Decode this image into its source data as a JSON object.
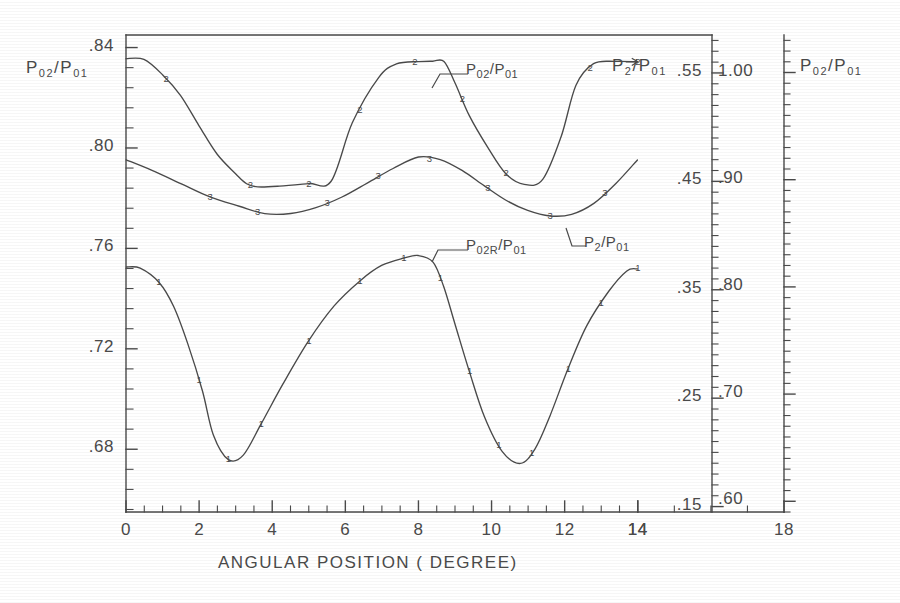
{
  "chart_data": {
    "type": "line",
    "title": "",
    "xlabel": "ANGULAR POSITION ( DEGREE)",
    "xlim": [
      0,
      18
    ],
    "x_ticks": [
      0,
      2,
      4,
      6,
      8,
      10,
      12,
      14,
      18
    ],
    "x_tick_labels": [
      "0",
      "2",
      "4",
      "6",
      "8",
      "10",
      "12",
      "14",
      "18"
    ],
    "x_extra_tick_label": "14",
    "grid": false,
    "legend_position": "inline-annotations",
    "axes": [
      {
        "id": "left",
        "label": "P02/P01",
        "label_parts": {
          "base1": "P",
          "sub1": "02",
          "slash": "/",
          "base2": "P",
          "sub2": "01"
        },
        "ticks": [
          0.68,
          0.72,
          0.76,
          0.8,
          0.84
        ],
        "tick_labels": [
          ".68",
          ".72",
          ".76",
          ".80",
          ".84"
        ],
        "lim": [
          0.655,
          0.845
        ],
        "minor_per_major": 4,
        "side": "left"
      },
      {
        "id": "mid-right",
        "label": "P2/P01",
        "label_parts": {
          "base1": "P",
          "sub1": "2",
          "slash": "/",
          "base2": "P",
          "sub2": "01"
        },
        "ticks": [
          0.15,
          0.25,
          0.35,
          0.45,
          0.55
        ],
        "tick_labels": [
          ".15",
          ".25",
          ".35",
          ".45",
          ".55"
        ],
        "lim": [
          0.145,
          0.585
        ],
        "minor_per_major": 10,
        "side": "right"
      },
      {
        "id": "far-right",
        "label": "P02/P01",
        "label_parts": {
          "base1": "P",
          "sub1": "02",
          "slash": "/",
          "base2": "P",
          "sub2": "01"
        },
        "ticks": [
          0.6,
          0.7,
          0.8,
          0.9,
          1.0
        ],
        "tick_labels": [
          ".60",
          ".70",
          ".80",
          ".90",
          "1.00"
        ],
        "lim": [
          0.59,
          1.035
        ],
        "minor_per_major": 10,
        "side": "right"
      }
    ],
    "series": [
      {
        "name": "P02/P01",
        "annotation": "P02/P01",
        "annotation_parts": {
          "base1": "P",
          "sub1": "02",
          "slash": "/",
          "base2": "P",
          "sub2": "01"
        },
        "marker": "2",
        "axis": "far-right",
        "x": [
          0.0,
          0.5,
          1.0,
          1.5,
          2.0,
          2.5,
          3.0,
          3.3,
          3.6,
          4.2,
          5.0,
          5.6,
          6.2,
          6.9,
          7.4,
          8.0,
          8.4,
          8.7,
          9.0,
          9.4,
          9.9,
          10.4,
          10.9,
          11.4,
          11.9,
          12.3,
          12.8,
          13.4,
          14.0
        ],
        "y": [
          1.013,
          1.012,
          0.998,
          0.979,
          0.95,
          0.924,
          0.905,
          0.896,
          0.893,
          0.894,
          0.896,
          0.899,
          0.953,
          0.995,
          1.008,
          1.01,
          1.011,
          1.01,
          0.99,
          0.96,
          0.93,
          0.906,
          0.896,
          0.9,
          0.94,
          0.988,
          1.008,
          1.01,
          1.01
        ],
        "marker_x": [
          1.1,
          3.4,
          5.0,
          6.4,
          7.9,
          9.2,
          10.4,
          12.7,
          14.0
        ],
        "arrow_at_end": true
      },
      {
        "name": "P2/P01",
        "annotation": "P 2/P01",
        "annotation_parts": {
          "base1": "P",
          "sub1": "2",
          "slash": "/",
          "base2": "P",
          "sub2": "01"
        },
        "marker": "3",
        "axis": "mid-right",
        "x": [
          0.0,
          0.7,
          1.5,
          2.3,
          3.1,
          3.8,
          4.5,
          5.2,
          5.9,
          6.6,
          7.3,
          8.0,
          8.6,
          9.2,
          9.8,
          10.4,
          11.0,
          11.6,
          12.2,
          12.8,
          13.4,
          14.0
        ],
        "y": [
          0.47,
          0.46,
          0.448,
          0.436,
          0.427,
          0.42,
          0.42,
          0.426,
          0.436,
          0.449,
          0.462,
          0.472,
          0.47,
          0.46,
          0.446,
          0.433,
          0.423,
          0.418,
          0.42,
          0.43,
          0.448,
          0.47
        ],
        "marker_x": [
          2.3,
          3.6,
          5.5,
          6.9,
          8.3,
          9.9,
          11.6,
          13.1
        ],
        "arrow_at_end": false
      },
      {
        "name": "P02R/P01",
        "annotation": "P02R/P01",
        "annotation_parts": {
          "base1": "P",
          "sub1": "02R",
          "slash": "/",
          "base2": "P",
          "sub2": "01"
        },
        "marker": "1",
        "axis": "left",
        "x": [
          0.0,
          0.4,
          0.9,
          1.3,
          1.7,
          2.1,
          2.4,
          2.8,
          3.2,
          3.7,
          4.3,
          5.0,
          5.7,
          6.4,
          7.0,
          7.6,
          8.0,
          8.4,
          8.7,
          9.0,
          9.4,
          9.8,
          10.3,
          10.8,
          11.2,
          11.6,
          12.1,
          12.6,
          13.2,
          13.7,
          14.0
        ],
        "y": [
          0.7525,
          0.752,
          0.7465,
          0.737,
          0.722,
          0.703,
          0.6855,
          0.676,
          0.6775,
          0.69,
          0.706,
          0.723,
          0.737,
          0.747,
          0.753,
          0.756,
          0.757,
          0.7545,
          0.745,
          0.73,
          0.711,
          0.693,
          0.679,
          0.6745,
          0.68,
          0.693,
          0.712,
          0.729,
          0.743,
          0.751,
          0.752
        ],
        "marker_x": [
          0.9,
          2.0,
          2.8,
          3.7,
          5.0,
          6.4,
          7.6,
          8.6,
          9.4,
          10.2,
          11.1,
          12.1,
          13.0,
          14.0
        ],
        "arrow_at_end": false
      }
    ]
  },
  "axis_titles": {
    "left": {
      "base1": "P",
      "sub1": "02",
      "slash": "/",
      "base2": "P",
      "sub2": "01"
    },
    "mid": {
      "base1": "P",
      "sub1": "2",
      "slash": "/",
      "base2": "P",
      "sub2": "01"
    },
    "right": {
      "base1": "P",
      "sub1": "02",
      "slash": "/",
      "base2": "P",
      "sub2": "01"
    }
  },
  "left_ticks": [
    {
      "value": 0.84,
      "label": ".84"
    },
    {
      "value": 0.8,
      "label": ".80"
    },
    {
      "value": 0.76,
      "label": ".76"
    },
    {
      "value": 0.72,
      "label": ".72"
    },
    {
      "value": 0.68,
      "label": ".68"
    }
  ],
  "mid_ticks": [
    {
      "value": 0.55,
      "label": ".55"
    },
    {
      "value": 0.45,
      "label": ".45"
    },
    {
      "value": 0.35,
      "label": ".35"
    },
    {
      "value": 0.25,
      "label": ".25"
    },
    {
      "value": 0.15,
      "label": ".15"
    }
  ],
  "right_ticks": [
    {
      "value": 1.0,
      "label": "1.00"
    },
    {
      "value": 0.9,
      "label": ".90"
    },
    {
      "value": 0.8,
      "label": ".80"
    },
    {
      "value": 0.7,
      "label": ".70"
    },
    {
      "value": 0.6,
      "label": ".60"
    }
  ],
  "x_tick_labels": [
    "0",
    "2",
    "4",
    "6",
    "8",
    "10",
    "12",
    "14"
  ],
  "x_outer_labels": [
    "14",
    "18"
  ],
  "xaxis_title": "ANGULAR POSITION ( DEGREE)"
}
